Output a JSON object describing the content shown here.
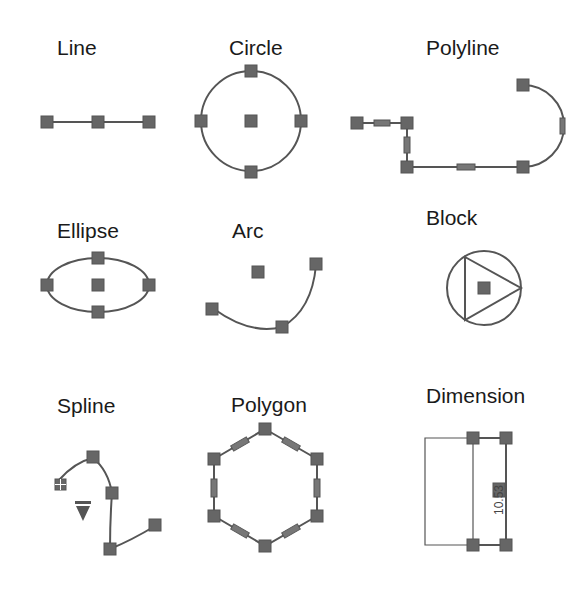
{
  "shapes": [
    {
      "id": "line",
      "label": "Line"
    },
    {
      "id": "circle",
      "label": "Circle"
    },
    {
      "id": "polyline",
      "label": "Polyline"
    },
    {
      "id": "ellipse",
      "label": "Ellipse"
    },
    {
      "id": "arc",
      "label": "Arc"
    },
    {
      "id": "block",
      "label": "Block"
    },
    {
      "id": "spline",
      "label": "Spline"
    },
    {
      "id": "polygon",
      "label": "Polygon"
    },
    {
      "id": "dimension",
      "label": "Dimension",
      "value": "10.53"
    }
  ],
  "colors": {
    "stroke": "#555555",
    "grip": "#666666",
    "text": "#1a1a1a",
    "background": "#ffffff"
  }
}
